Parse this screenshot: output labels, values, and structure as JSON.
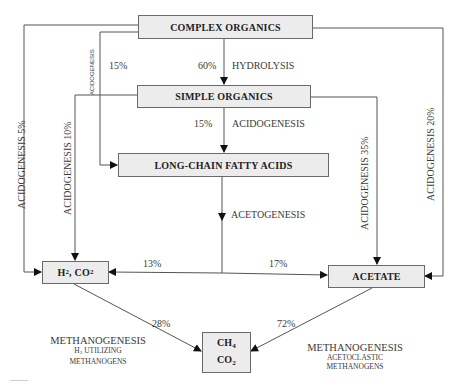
{
  "diagram": {
    "type": "flowchart",
    "nodes": {
      "complex_organics": "COMPLEX ORGANICS",
      "simple_organics": "SIMPLE ORGANICS",
      "lcfa": "LONG-CHAIN FATTY ACIDS",
      "h2_co2": {
        "main1": "H",
        "sub1": "2",
        "mid": ", CO",
        "sub2": "2"
      },
      "acetate": "ACETATE",
      "ch4_co2": {
        "line1_main": "CH",
        "line1_sub": "4",
        "line2_main": "CO",
        "line2_sub": "2"
      }
    },
    "edges": [
      {
        "from": "COMPLEX ORGANICS",
        "to": "SIMPLE ORGANICS",
        "process": "HYDROLYSIS",
        "percent": "60%"
      },
      {
        "from": "COMPLEX ORGANICS",
        "to": "LONG-CHAIN FATTY ACIDS",
        "process": "ACIDOGENESIS",
        "percent": "15%"
      },
      {
        "from": "COMPLEX ORGANICS",
        "to": "H2, CO2",
        "process": "ACIDOGENESIS",
        "percent": "5%"
      },
      {
        "from": "COMPLEX ORGANICS",
        "to": "ACETATE",
        "process": "ACIDOGENESIS",
        "percent": "20%"
      },
      {
        "from": "SIMPLE ORGANICS",
        "to": "LONG-CHAIN FATTY ACIDS",
        "process": "ACIDOGENESIS",
        "percent": "15%"
      },
      {
        "from": "SIMPLE ORGANICS",
        "to": "H2, CO2",
        "process": "ACIDOGENESIS",
        "percent": "10%"
      },
      {
        "from": "SIMPLE ORGANICS",
        "to": "ACETATE",
        "process": "ACIDOGENESIS",
        "percent": "35%"
      },
      {
        "from": "LONG-CHAIN FATTY ACIDS",
        "to": "H2, CO2",
        "process": "ACETOGENESIS",
        "percent": "13%"
      },
      {
        "from": "LONG-CHAIN FATTY ACIDS",
        "to": "ACETATE",
        "process": "ACETOGENESIS",
        "percent": "17%"
      },
      {
        "from": "H2, CO2",
        "to": "CH4, CO2",
        "process": "METHANOGENESIS",
        "percent": "28%"
      },
      {
        "from": "ACETATE",
        "to": "CH4, CO2",
        "process": "METHANOGENESIS",
        "percent": "72%"
      }
    ],
    "labels": {
      "hydrolysis": "HYDROLYSIS",
      "pct_60": "60%",
      "pct_15_top": "15%",
      "acidogenesis_small": "ACIDOGENESIS",
      "pct_15_mid": "15%",
      "acidogenesis_mid": "ACIDOGENESIS",
      "acetogenesis": "ACETOGENESIS",
      "acidogenesis_5": "ACIDOGENESIS  5%",
      "acidogenesis_10": "ACIDOGENESIS  10%",
      "acidogenesis_35": "ACIDOGENESIS  35%",
      "acidogenesis_20": "ACIDOGENESIS  20%",
      "pct_13": "13%",
      "pct_17": "17%",
      "pct_28": "28%",
      "pct_72": "72%",
      "methanogenesis_left": {
        "title": "METHANOGENESIS",
        "line2_pre": "H",
        "line2_sub": "2",
        "line2_post": " UTILIZING",
        "line3": "METHANOGENS"
      },
      "methanogenesis_right": {
        "title": "METHANOGENESIS",
        "line2": "ACETOCLASTIC",
        "line3": "METHANOGENS"
      }
    },
    "colors": {
      "box_fill": "#ececec",
      "box_border": "#6a6a6a",
      "line": "#555555",
      "text": "#2a2a2a"
    }
  }
}
